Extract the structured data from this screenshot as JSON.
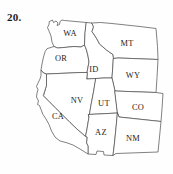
{
  "figure": {
    "item_number": "20.",
    "kind": "outline-map",
    "region": "Western United States",
    "background_color": "#fefefe",
    "outline_color": "#4a4a4a",
    "label_color": "#1d1d1d"
  },
  "map": {
    "states": [
      {
        "abbr": "WA",
        "label_x": 70,
        "label_y": 34,
        "path": "M 49.5 21.5 L 52.5 20.0 L 53.5 22.5 L 56.0 21.0 L 58.0 23.0 L 57.0 25.5 L 59.5 24.5 L 60.0 21.5 L 62.0 20.0 L 64.5 20.5 L 86.5 22.5 L 85.0 33.0 L 84.5 45.0 L 81.0 47.0 L 74.0 46.5 L 64.0 47.5 L 57.5 48.0 L 54.0 46.5 L 52.0 42.0 L 51.0 36.0 L 49.0 31.0 L 47.5 27.5 L 49.0 24.5 Z"
      },
      {
        "abbr": "OR",
        "label_x": 61,
        "label_y": 59,
        "path": "M 47.5 48.5 L 54.0 46.5 L 57.5 48.0 L 64.0 47.5 L 74.0 46.5 L 81.0 47.0 L 84.5 45.0 L 86.5 50.0 L 88.0 56.0 L 89.0 62.0 L 87.0 72.5 L 80.0 72.5 L 70.0 73.0 L 58.0 73.5 L 46.5 74.0 L 43.5 73.0 L 41.0 70.0 L 42.0 64.0 L 43.5 57.0 L 45.0 52.0 Z"
      },
      {
        "abbr": "ID",
        "label_x": 94,
        "label_y": 70,
        "path": "M 86.5 22.5 L 92.0 23.0 L 93.5 27.0 L 92.0 31.5 L 95.0 36.0 L 97.5 40.0 L 99.5 44.0 L 103.0 47.0 L 106.5 50.0 L 110.0 52.5 L 113.0 54.5 L 113.5 58.5 L 113.0 63.5 L 112.5 71.0 L 112.0 78.0 L 104.0 78.0 L 96.0 78.5 L 87.0 79.0 L 87.0 72.5 L 89.0 62.0 L 88.0 56.0 L 86.5 50.0 L 84.5 45.0 L 85.0 33.0 Z"
      },
      {
        "abbr": "MT",
        "label_x": 127,
        "label_y": 44,
        "path": "M 92.0 23.0 L 100.5 22.5 L 112.0 23.5 L 126.0 25.0 L 140.0 26.5 L 156.0 28.5 L 157.5 46.5 L 158.0 59.5 L 145.0 59.0 L 132.0 58.5 L 118.0 58.0 L 113.5 58.5 L 113.0 54.5 L 110.0 52.5 L 106.5 50.0 L 103.0 47.0 L 99.5 44.0 L 97.5 40.0 L 95.0 36.0 L 92.0 31.5 L 93.5 27.0 Z"
      },
      {
        "abbr": "WY",
        "label_x": 133,
        "label_y": 76,
        "path": "M 113.5 58.5 L 118.0 58.0 L 132.0 58.5 L 145.0 59.0 L 158.0 59.5 L 157.0 77.5 L 156.0 92.5 L 142.0 92.0 L 128.0 91.5 L 115.0 91.0 L 112.0 78.0 L 112.5 71.0 L 113.0 63.5 Z"
      },
      {
        "abbr": "NV",
        "label_x": 77,
        "label_y": 101,
        "path": "M 87.0 79.0 L 96.0 78.5 L 93.5 92.0 L 91.0 105.0 L 89.0 117.0 L 87.0 129.0 L 85.5 136.5 L 78.0 130.0 L 70.0 122.5 L 62.0 114.5 L 55.0 107.5 L 49.0 101.5 L 43.5 96.0 L 46.5 85.0 L 46.5 74.0 L 58.0 73.5 L 70.0 73.0 L 80.0 72.5 L 87.0 72.5 Z"
      },
      {
        "abbr": "UT",
        "label_x": 104,
        "label_y": 104,
        "path": "M 96.0 78.5 L 104.0 78.0 L 112.0 78.0 L 115.0 91.0 L 117.5 113.0 L 108.0 113.5 L 98.0 114.0 L 88.5 114.5 L 89.0 117.0 L 91.0 105.0 L 93.5 92.0 Z"
      },
      {
        "abbr": "CO",
        "label_x": 138,
        "label_y": 108,
        "path": "M 115.0 91.0 L 128.0 91.5 L 142.0 92.0 L 156.0 92.5 L 163.0 93.5 L 162.0 108.5 L 161.0 121.5 L 147.0 120.0 L 133.0 118.5 L 119.0 117.0 L 117.5 113.0 Z"
      },
      {
        "abbr": "AZ",
        "label_x": 101,
        "label_y": 133,
        "path": "M 88.5 114.5 L 98.0 114.0 L 108.0 113.5 L 117.5 113.0 L 116.0 128.0 L 114.5 143.0 L 113.0 155.5 L 104.0 155.0 L 103.5 151.5 L 97.0 151.0 L 96.0 154.5 L 88.0 154.0 L 88.0 146.0 L 86.5 143.0 L 87.0 137.0 L 85.5 136.5 L 87.0 129.0 L 89.0 117.0 Z"
      },
      {
        "abbr": "NM",
        "label_x": 133,
        "label_y": 139,
        "path": "M 117.5 113.0 L 119.0 117.0 L 133.0 118.5 L 147.0 120.0 L 161.0 121.5 L 159.5 137.0 L 158.0 152.0 L 144.0 152.5 L 130.0 153.0 L 116.0 153.5 L 113.0 155.5 L 114.5 143.0 L 116.0 128.0 Z"
      },
      {
        "abbr": "CA",
        "label_x": 58,
        "label_y": 117,
        "path": "M 43.5 96.0 L 49.0 101.5 L 55.0 107.5 L 62.0 114.5 L 70.0 122.5 L 78.0 130.0 L 85.5 136.5 L 87.0 137.0 L 86.5 143.0 L 88.0 146.0 L 88.0 154.0 L 80.0 149.0 L 73.0 145.0 L 66.0 142.5 L 60.0 141.0 L 55.0 137.0 L 51.5 131.0 L 49.0 124.5 L 46.0 119.0 L 43.0 114.5 L 41.0 109.5 L 39.5 105.5 L 37.5 104.5 L 38.5 101.0 L 36.5 97.0 L 37.0 93.0 L 38.0 89.5 L 36.5 86.5 L 38.0 83.0 L 40.0 79.0 L 41.0 75.5 L 41.0 70.0 L 43.5 73.0 L 46.5 74.0 L 46.5 85.0 Z"
      }
    ]
  }
}
